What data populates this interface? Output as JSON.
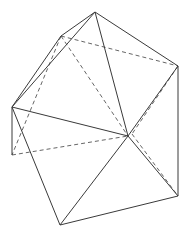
{
  "diagram": {
    "title": "",
    "type": "polyhedron-wireframe",
    "colors": {
      "stroke": "#3a3a3a",
      "background": "#ffffff"
    },
    "vertices": {
      "T": [
        95,
        12
      ],
      "UL": [
        61,
        36
      ],
      "R": [
        178,
        66
      ],
      "L": [
        12,
        107
      ],
      "C": [
        128,
        136
      ],
      "LL": [
        12,
        155
      ],
      "LR": [
        178,
        196
      ],
      "B": [
        60,
        225
      ]
    },
    "solid_edges": [
      [
        "T",
        "UL"
      ],
      [
        "T",
        "L"
      ],
      [
        "UL",
        "L"
      ],
      [
        "T",
        "R"
      ],
      [
        "T",
        "C"
      ],
      [
        "R",
        "C"
      ],
      [
        "R",
        "LR"
      ],
      [
        "L",
        "C"
      ],
      [
        "L",
        "LL"
      ],
      [
        "L",
        "B"
      ],
      [
        "C",
        "B"
      ],
      [
        "C",
        "LR"
      ],
      [
        "B",
        "LR"
      ]
    ],
    "dashed_edges": [
      [
        "UL",
        "R"
      ],
      [
        "UL",
        "C"
      ],
      [
        "UL",
        "LL"
      ],
      [
        "LL",
        "C"
      ],
      [
        "R",
        "C2"
      ],
      [
        "C2",
        "LR"
      ]
    ],
    "aux_points": {
      "C2": [
        132,
        134
      ]
    }
  }
}
